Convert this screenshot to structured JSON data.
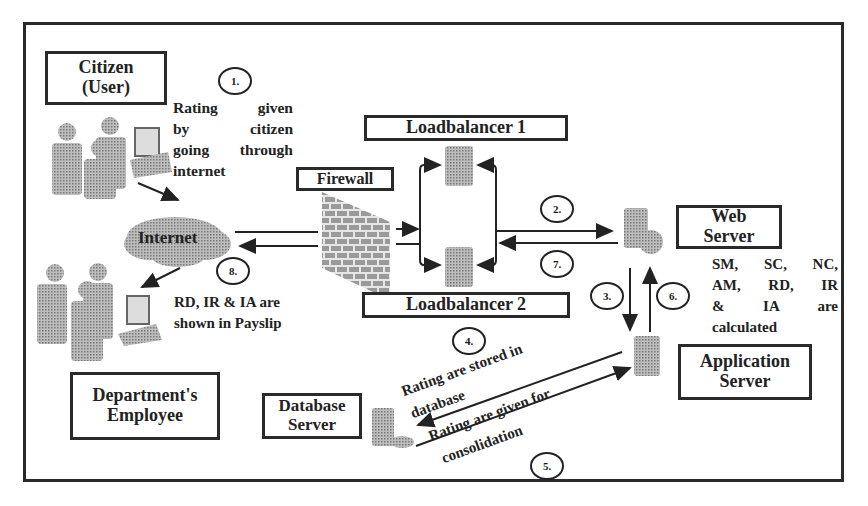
{
  "diagram": {
    "type": "system-architecture-flow",
    "nodes": {
      "citizen": {
        "label_line1": "Citizen",
        "label_line2": "(User)"
      },
      "internet": {
        "label": "Internet"
      },
      "firewall": {
        "label": "Firewall"
      },
      "loadbalancer1": {
        "label": "Loadbalancer 1"
      },
      "loadbalancer2": {
        "label": "Loadbalancer 2"
      },
      "web_server": {
        "label_line1": "Web",
        "label_line2": "Server"
      },
      "application_server": {
        "label_line1": "Application",
        "label_line2": "Server"
      },
      "database_server": {
        "label_line1": "Database",
        "label_line2": "Server"
      },
      "employee": {
        "label_line1": "Department's",
        "label_line2": "Employee"
      }
    },
    "steps": [
      {
        "num": "1.",
        "text": [
          "Rating given",
          "by citizen",
          "going through",
          "internet"
        ]
      },
      {
        "num": "2.",
        "text": []
      },
      {
        "num": "3.",
        "text": []
      },
      {
        "num": "4.",
        "text": [
          "Rating are stored in",
          "database"
        ]
      },
      {
        "num": "5.",
        "text": [
          "Rating are given for",
          "consolidation"
        ]
      },
      {
        "num": "6.",
        "text": [
          "SM, SC, NC,",
          "AM, RD, IR",
          "& IA are",
          "calculated"
        ]
      },
      {
        "num": "7.",
        "text": []
      },
      {
        "num": "8.",
        "text": [
          "RD, IR & IA are",
          "shown in Payslip"
        ]
      }
    ],
    "colors": {
      "stroke": "#2a2a2a",
      "icon_gray": "#9a9a9a",
      "cloud": "#c8c8c8",
      "background": "#ffffff"
    }
  }
}
